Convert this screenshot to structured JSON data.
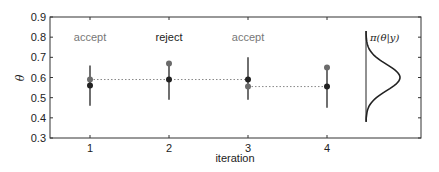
{
  "chart_data": {
    "type": "scatter",
    "title": "",
    "xlabel": "iteration",
    "ylabel": "θ",
    "xlim": [
      0.5,
      5.2
    ],
    "ylim": [
      0.3,
      0.9
    ],
    "x_ticks": [
      "1",
      "2",
      "3",
      "4"
    ],
    "y_ticks": [
      "0.3",
      "0.4",
      "0.5",
      "0.6",
      "0.7",
      "0.8",
      "0.9"
    ],
    "grid": false,
    "iterations": [
      {
        "x": 1,
        "label": "accept",
        "label_color": "#777777",
        "current": 0.56,
        "proposal": 0.59,
        "bar_low": 0.46,
        "bar_high": 0.66
      },
      {
        "x": 2,
        "label": "reject",
        "label_color": "#222222",
        "current": 0.59,
        "proposal": 0.67,
        "bar_low": 0.49,
        "bar_high": 0.67
      },
      {
        "x": 3,
        "label": "accept",
        "label_color": "#777777",
        "current": 0.59,
        "proposal": 0.555,
        "bar_low": 0.49,
        "bar_high": 0.7
      },
      {
        "x": 4,
        "label": "",
        "label_color": "#777777",
        "current": 0.555,
        "proposal": 0.65,
        "bar_low": 0.45,
        "bar_high": 0.65
      }
    ],
    "chain_path": [
      {
        "from_x": 1,
        "to_x": 3,
        "y": 0.59
      },
      {
        "from_x": 3,
        "to_x": 4,
        "y": 0.555
      }
    ],
    "posterior": {
      "label": "π(θ|y)",
      "mean": 0.6,
      "sd": 0.065,
      "y_range": [
        0.38,
        0.83
      ]
    },
    "colors": {
      "current_point": "#222222",
      "proposal_point": "#6b6b6b",
      "bar": "#222222",
      "chain_line": "#888888"
    }
  }
}
